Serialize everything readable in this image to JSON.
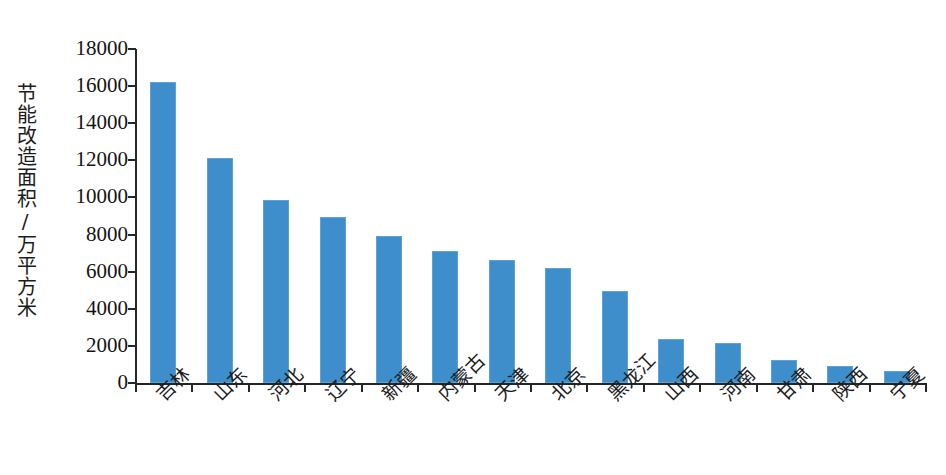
{
  "chart_data": {
    "type": "bar",
    "title": "",
    "xlabel": "",
    "ylabel": "节能改造面积/万平方米",
    "ylim": [
      0,
      18000
    ],
    "ytick_step": 2000,
    "ytick_labels": [
      "18000",
      "16000",
      "14000",
      "12000",
      "10000",
      "8000",
      "6000",
      "4000",
      "2000",
      "0"
    ],
    "ytick_values": [
      18000,
      16000,
      14000,
      12000,
      10000,
      8000,
      6000,
      4000,
      2000,
      0
    ],
    "grid": false,
    "legend": false,
    "bar_color": "#3d8ecb",
    "bar_edge_color": "#5ba3d9",
    "axis_color": "#262626",
    "categories": [
      "吉林",
      "山东",
      "河北",
      "辽宁",
      "新疆",
      "内蒙古",
      "天津",
      "北京",
      "黑龙江",
      "山西",
      "河南",
      "甘肃",
      "陕西",
      "宁夏"
    ],
    "values": [
      16200,
      12100,
      9850,
      8950,
      7900,
      7100,
      6650,
      6200,
      4950,
      2380,
      2130,
      1250,
      900,
      650
    ]
  }
}
